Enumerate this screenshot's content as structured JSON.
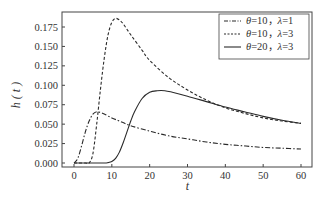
{
  "chart_data": {
    "type": "line",
    "title": "",
    "xlabel": "t",
    "ylabel": "h ( t )",
    "xlim": [
      -3,
      63
    ],
    "ylim": [
      -0.006,
      0.197
    ],
    "xticks": [
      0,
      10,
      20,
      30,
      40,
      50,
      60
    ],
    "xtick_labels": [
      "0",
      "10",
      "20",
      "30",
      "40",
      "50",
      "60"
    ],
    "yticks": [
      0.0,
      0.025,
      0.05,
      0.075,
      0.1,
      0.125,
      0.15,
      0.175
    ],
    "ytick_labels": [
      "0.000",
      "0.025",
      "0.050",
      "0.075",
      "0.100",
      "0.125",
      "0.150",
      "0.175"
    ],
    "grid": false,
    "legend_position": "upper right",
    "series": [
      {
        "name": "θ=10，λ=1",
        "legend_theta": "θ",
        "legend_text": "=10，",
        "legend_lambda": "λ",
        "legend_text2": "=1",
        "style": "dashdot",
        "x": [
          0,
          1,
          2,
          3,
          4,
          5,
          6,
          7,
          8,
          10,
          12,
          15,
          20,
          25,
          30,
          35,
          40,
          45,
          50,
          55,
          60
        ],
        "y": [
          0.0,
          0.006,
          0.022,
          0.04,
          0.054,
          0.063,
          0.066,
          0.065,
          0.063,
          0.058,
          0.054,
          0.048,
          0.041,
          0.035,
          0.031,
          0.027,
          0.024,
          0.022,
          0.02,
          0.019,
          0.018
        ]
      },
      {
        "name": "θ=10，λ=3",
        "legend_theta": "θ",
        "legend_text": "=10，",
        "legend_lambda": "λ",
        "legend_text2": "=3",
        "style": "dashed",
        "x": [
          0,
          3,
          4,
          5,
          6,
          7,
          8,
          9,
          10,
          11,
          12,
          13,
          15,
          18,
          20,
          25,
          30,
          35,
          40,
          45,
          50,
          55,
          60
        ],
        "y": [
          0.0,
          0.0,
          0.0,
          0.012,
          0.05,
          0.095,
          0.135,
          0.165,
          0.181,
          0.186,
          0.184,
          0.179,
          0.165,
          0.145,
          0.132,
          0.11,
          0.094,
          0.081,
          0.071,
          0.064,
          0.058,
          0.054,
          0.051
        ]
      },
      {
        "name": "θ=20，λ=3",
        "legend_theta": "θ",
        "legend_text": "=20，",
        "legend_lambda": "λ",
        "legend_text2": "=3",
        "style": "solid",
        "x": [
          0,
          5,
          8,
          9,
          10,
          11,
          12,
          13,
          14,
          15,
          16,
          18,
          20,
          22,
          24,
          26,
          30,
          35,
          40,
          45,
          50,
          55,
          60
        ],
        "y": [
          0.0,
          0.0,
          0.0,
          0.0005,
          0.002,
          0.006,
          0.014,
          0.026,
          0.04,
          0.054,
          0.066,
          0.083,
          0.091,
          0.093,
          0.093,
          0.091,
          0.086,
          0.079,
          0.072,
          0.066,
          0.06,
          0.055,
          0.051
        ]
      }
    ]
  },
  "layout": {
    "plot_left": 62,
    "plot_top": 12,
    "plot_right": 312,
    "plot_bottom": 167
  }
}
